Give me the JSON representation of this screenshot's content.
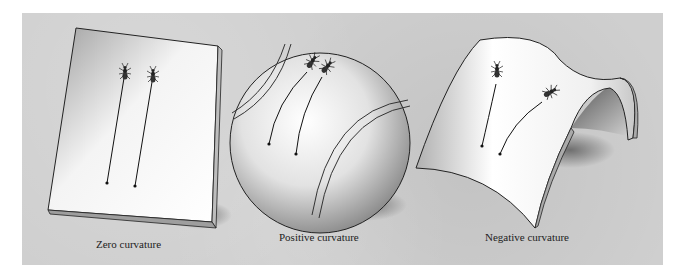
{
  "figure": {
    "panels": [
      {
        "id": "zero",
        "caption": "Zero curvature",
        "surface": "flat-plane"
      },
      {
        "id": "positive",
        "caption": "Positive curvature",
        "surface": "sphere"
      },
      {
        "id": "negative",
        "caption": "Negative curvature",
        "surface": "saddle"
      }
    ],
    "colors": {
      "background_panel": "#cfcfcf",
      "surface_light": "#ffffff",
      "surface_shade": "#9a9a9a",
      "line": "#111111"
    }
  }
}
